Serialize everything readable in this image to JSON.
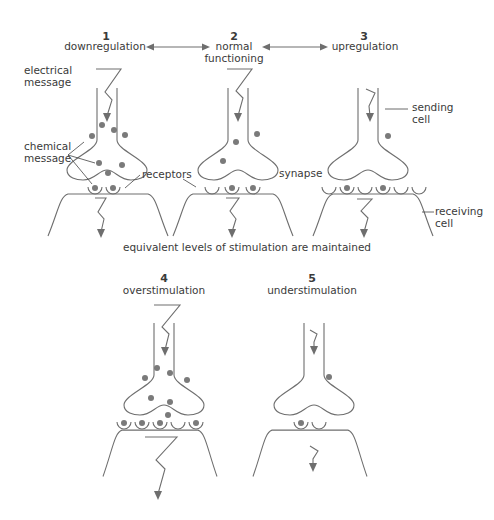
{
  "panels": [
    {
      "number": "1",
      "label": "downregulation"
    },
    {
      "number": "2",
      "label_line1": "normal",
      "label_line2": "functioning"
    },
    {
      "number": "3",
      "label": "upregulation"
    },
    {
      "number": "4",
      "label": "overstimulation"
    },
    {
      "number": "5",
      "label": "understimulation"
    }
  ],
  "callouts": {
    "electrical_message": [
      "electrical",
      "message"
    ],
    "chemical_message": [
      "chemical",
      "message"
    ],
    "receptors": "receptors",
    "synapse": "synapse",
    "sending_cell": [
      "sending",
      "cell"
    ],
    "receiving_cell": [
      "receiving",
      "cell"
    ]
  },
  "caption": "equivalent levels of stimulation are maintained",
  "colors": {
    "line": "#6e6e6e",
    "dot": "#7a7a7a",
    "text": "#3a3a3a"
  }
}
